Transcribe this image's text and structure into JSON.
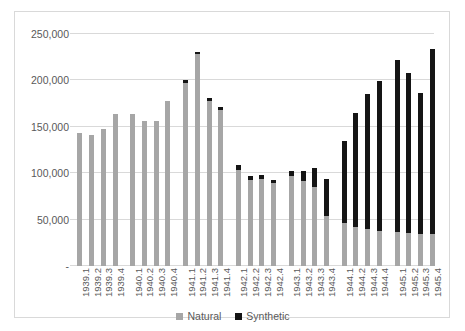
{
  "chart_data": {
    "type": "bar",
    "subtype": "stacked-column",
    "title": "",
    "xlabel": "",
    "ylabel": "",
    "ylim": [
      0,
      250000
    ],
    "grid": true,
    "legend_position": "bottom",
    "categories": [
      "1939.1",
      "1939.2",
      "1939.3",
      "1939.4",
      "1940.1",
      "1940.2",
      "1940.3",
      "1940.4",
      "1941.1",
      "1941.2",
      "1941.3",
      "1941.4",
      "1942.1",
      "1942.2",
      "1942.3",
      "1942.4",
      "1943.1",
      "1943.2",
      "1943.3",
      "1943.4",
      "1944.1",
      "1944.2",
      "1944.3",
      "1944.4",
      "1945.1",
      "1945.2",
      "1945.3",
      "1945.4"
    ],
    "series": [
      {
        "name": "Natural",
        "color": "#a6a6a6",
        "values": [
          143000,
          141000,
          148000,
          164000,
          164000,
          156000,
          156000,
          178000,
          197000,
          228000,
          178000,
          168000,
          104000,
          93000,
          94000,
          89000,
          97000,
          92000,
          85000,
          54000,
          46000,
          42000,
          40000,
          38000,
          37000,
          36000,
          35000,
          34000
        ]
      },
      {
        "name": "Synthetic",
        "color": "#151515",
        "values": [
          0,
          0,
          0,
          0,
          0,
          0,
          0,
          0,
          3000,
          3000,
          3000,
          3000,
          5000,
          4000,
          4000,
          4000,
          5000,
          10000,
          21000,
          40000,
          89000,
          123000,
          145000,
          161000,
          185000,
          172000,
          151000,
          200000
        ]
      }
    ],
    "y_ticks": [
      {
        "value": 250000,
        "label": "250,000"
      },
      {
        "value": 200000,
        "label": "200,000"
      },
      {
        "value": 150000,
        "label": "150,000"
      },
      {
        "value": 100000,
        "label": "100,000"
      },
      {
        "value": 50000,
        "label": "50,000"
      },
      {
        "value": 0,
        "label": "-"
      }
    ],
    "legend": [
      {
        "label": "Natural",
        "color": "#a6a6a6"
      },
      {
        "label": "Synthetic",
        "color": "#151515"
      }
    ]
  }
}
